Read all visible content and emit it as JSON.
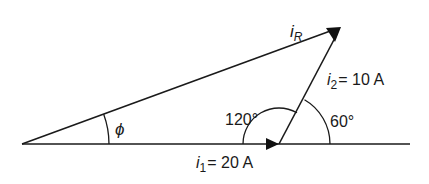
{
  "diagram": {
    "type": "phasor-diagram",
    "origin": {
      "x": 22,
      "y": 144
    },
    "junction": {
      "x": 279,
      "y": 144
    },
    "tip": {
      "x": 341,
      "y": 27
    },
    "baseline_end": {
      "x": 410,
      "y": 144
    },
    "phasors": [
      {
        "id": "i1",
        "symbol": "i",
        "subscript": "1",
        "value_text": "= 20 A",
        "magnitude": 20,
        "unit": "A",
        "angle_deg": 0
      },
      {
        "id": "i2",
        "symbol": "i",
        "subscript": "2",
        "value_text": "= 10 A",
        "magnitude": 10,
        "unit": "A",
        "angle_deg": 60
      },
      {
        "id": "iR",
        "symbol": "i",
        "subscript": "R",
        "value_text": "",
        "resultant": true
      }
    ],
    "angles": {
      "phi": {
        "label": "ϕ",
        "radius": 87
      },
      "a120": {
        "label": "120°",
        "radius": 36
      },
      "a60": {
        "label": "60°",
        "radius": 51
      }
    },
    "labels": {
      "iR_symbol": "i",
      "iR_sub": "R",
      "i2_symbol": "i",
      "i2_sub": "2",
      "i2_value": "= 10 A",
      "i1_symbol": "i",
      "i1_sub": "1",
      "i1_value": "= 20 A",
      "angle_120": "120°",
      "angle_60": "60°",
      "angle_phi": "ϕ"
    },
    "colors": {
      "ink": "#1a1a1a",
      "background": "#ffffff"
    }
  }
}
